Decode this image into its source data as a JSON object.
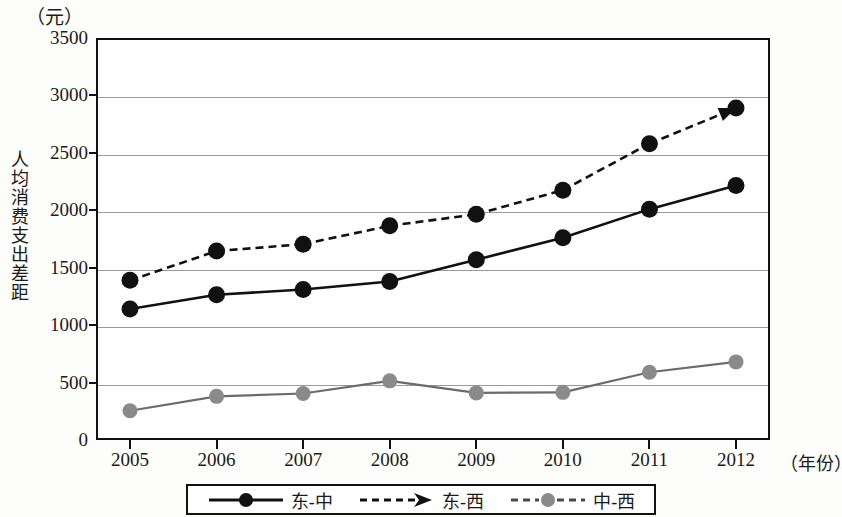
{
  "chart_data": {
    "type": "line",
    "title": "",
    "subtitle": "",
    "xlabel": "（年份）",
    "ylabel": "人均消费支出差距",
    "yunit": "（元）",
    "categories": [
      "2005",
      "2006",
      "2007",
      "2008",
      "2009",
      "2010",
      "2011",
      "2012"
    ],
    "ylim": [
      0,
      3500
    ],
    "yticks": [
      0,
      500,
      1000,
      1500,
      2000,
      2500,
      3000,
      3500
    ],
    "ytick_labels": [
      "0",
      "500",
      "1000",
      "1500",
      "2000",
      "2500",
      "3000",
      "3500"
    ],
    "grid": true,
    "legend_position": "bottom",
    "series": [
      {
        "name": "东-中",
        "values": [
          1140,
          1265,
          1310,
          1380,
          1570,
          1760,
          2010,
          2215
        ],
        "color": "#111111",
        "style": "solid",
        "marker": "circle",
        "marker_color": "#111111"
      },
      {
        "name": "东-西",
        "values": [
          1390,
          1645,
          1705,
          1865,
          1965,
          2175,
          2580,
          2890
        ],
        "color": "#111111",
        "style": "dashed",
        "marker": "circle",
        "marker_color": "#111111",
        "arrow_end": true
      },
      {
        "name": "中-西",
        "values": [
          255,
          380,
          405,
          515,
          410,
          415,
          590,
          680
        ],
        "color": "#6b6b6b",
        "style": "solid",
        "marker": "circle",
        "marker_color": "#8a8a8a"
      }
    ]
  },
  "legend": {
    "items": [
      {
        "label": "东-中",
        "icon": "solid-line-circle-icon"
      },
      {
        "label": "东-西",
        "icon": "dashed-line-arrow-icon"
      },
      {
        "label": "中-西",
        "icon": "dashed-line-gray-circle-icon"
      }
    ]
  },
  "colors": {
    "axis": "#111111",
    "grid": "#9a9a9a",
    "series_dark": "#111111",
    "series_gray": "#8a8a8a",
    "background": "#ffffff"
  }
}
